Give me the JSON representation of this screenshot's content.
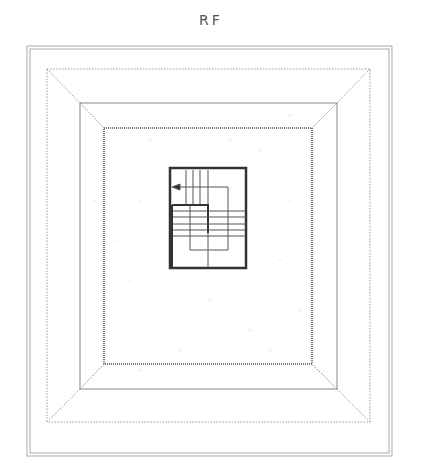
{
  "title": "RF",
  "plan": {
    "outer_border": {
      "x1": 27,
      "y1": 46,
      "x2": 392,
      "y2": 456
    },
    "eave_line": {
      "x1": 47,
      "y1": 69,
      "x2": 370,
      "y2": 422
    },
    "parapet": {
      "x1": 80,
      "y1": 103,
      "x2": 337,
      "y2": 389
    },
    "roof_slab": {
      "x1": 104,
      "y1": 128,
      "x2": 312,
      "y2": 364
    },
    "stair": {
      "x1": 170,
      "y1": 168,
      "x2": 246,
      "y2": 268
    }
  },
  "colors": {
    "line": "#888888",
    "dark": "#333333",
    "dot": "#999999"
  }
}
